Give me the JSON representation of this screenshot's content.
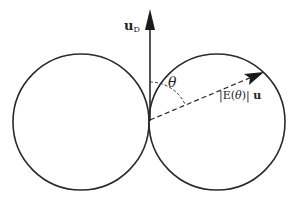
{
  "diagram": {
    "type": "radiation-pattern",
    "labels": {
      "vector_u": "u",
      "vector_u_sub": "D",
      "angle": "θ",
      "magnitude_prefix": "|E(",
      "magnitude_theta": "θ",
      "magnitude_suffix": ")|",
      "magnitude_vector": "u"
    },
    "colors": {
      "stroke": "#2a2a2a",
      "background": "#ffffff"
    },
    "geometry": {
      "origin": [
        149,
        121
      ],
      "left_circle": {
        "cx": 81,
        "cy": 122,
        "r": 68
      },
      "right_circle": {
        "cx": 217,
        "cy": 122,
        "r": 68
      },
      "vertical_arrow_tip": [
        150,
        10
      ],
      "dashed_arrow_tip": [
        263,
        72
      ]
    }
  }
}
